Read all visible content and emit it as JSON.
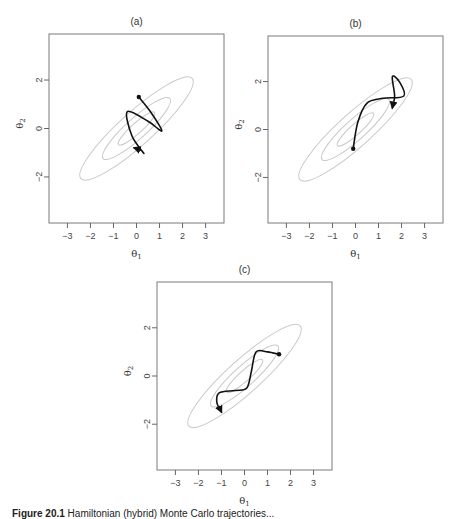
{
  "figure": {
    "caption_label": "Figure 20.1",
    "caption_text": "Hamiltonian (hybrid) Monte Carlo trajectories...",
    "caption_note": "caption truncated at image bottom edge"
  },
  "chart_data": [
    {
      "type": "line",
      "panel": "a",
      "title": "(a)",
      "xlabel": "θ1",
      "ylabel": "θ2",
      "xlim": [
        -3.8,
        3.8
      ],
      "ylim": [
        -3.9,
        3.9
      ],
      "xticks": [
        -3,
        -2,
        -1,
        0,
        1,
        2,
        3
      ],
      "yticks": [
        -2,
        0,
        2
      ],
      "grid": false,
      "contours": {
        "center": [
          0,
          0
        ],
        "levels": 3,
        "orientation_deg": 45,
        "color": "#c9c9c9"
      },
      "trajectory": {
        "start": [
          0.1,
          1.3
        ],
        "points": [
          [
            0.1,
            1.3
          ],
          [
            0.6,
            0.7
          ],
          [
            1.1,
            -0.1
          ],
          [
            0.5,
            0.3
          ],
          [
            -0.4,
            0.7
          ],
          [
            -0.2,
            -0.3
          ],
          [
            0.3,
            -1.0
          ],
          [
            0.2,
            -0.9
          ],
          [
            -0.1,
            -0.8
          ]
        ],
        "end_arrow": [
          -0.1,
          -0.8
        ]
      }
    },
    {
      "type": "line",
      "panel": "b",
      "title": "(b)",
      "xlabel": "θ1",
      "ylabel": "θ2",
      "xlim": [
        -3.8,
        3.8
      ],
      "ylim": [
        -3.9,
        3.9
      ],
      "xticks": [
        -3,
        -2,
        -1,
        0,
        1,
        2,
        3
      ],
      "yticks": [
        -2,
        0,
        2
      ],
      "grid": false,
      "contours": {
        "center": [
          0,
          0
        ],
        "levels": 3,
        "orientation_deg": 45,
        "color": "#c9c9c9"
      },
      "trajectory": {
        "start": [
          -0.1,
          -0.8
        ],
        "points": [
          [
            -0.1,
            -0.8
          ],
          [
            0.1,
            0.3
          ],
          [
            0.5,
            1.1
          ],
          [
            1.2,
            1.3
          ],
          [
            2.1,
            1.4
          ],
          [
            1.9,
            2.0
          ],
          [
            1.6,
            2.2
          ],
          [
            1.7,
            1.4
          ],
          [
            1.6,
            0.9
          ]
        ],
        "end_arrow": [
          1.6,
          0.9
        ]
      }
    },
    {
      "type": "line",
      "panel": "c",
      "title": "(c)",
      "xlabel": "θ1",
      "ylabel": "θ2",
      "xlim": [
        -3.8,
        3.8
      ],
      "ylim": [
        -3.9,
        3.9
      ],
      "xticks": [
        -3,
        -2,
        -1,
        0,
        1,
        2,
        3
      ],
      "yticks": [
        -2,
        0,
        2
      ],
      "grid": false,
      "contours": {
        "center": [
          0,
          0
        ],
        "levels": 3,
        "orientation_deg": 45,
        "color": "#c9c9c9"
      },
      "trajectory": {
        "start": [
          1.5,
          0.9
        ],
        "points": [
          [
            1.5,
            0.9
          ],
          [
            1.0,
            1.0
          ],
          [
            0.5,
            1.0
          ],
          [
            0.3,
            0.2
          ],
          [
            0.1,
            -0.5
          ],
          [
            -0.4,
            -0.6
          ],
          [
            -1.1,
            -0.7
          ],
          [
            -1.2,
            -1.1
          ],
          [
            -1.0,
            -1.5
          ]
        ],
        "end_arrow": [
          -1.0,
          -1.5
        ]
      }
    }
  ],
  "panels": {
    "a": {
      "title": "(a)"
    },
    "b": {
      "title": "(b)"
    },
    "c": {
      "title": "(c)"
    }
  },
  "axes": {
    "xlabel_main": "θ",
    "xlabel_sub": "1",
    "ylabel_main": "θ",
    "ylabel_sub": "2",
    "xtick_labels": [
      "−3",
      "−2",
      "−1",
      "0",
      "1",
      "2",
      "3"
    ],
    "ytick_labels": [
      "−2",
      "0",
      "2"
    ]
  }
}
